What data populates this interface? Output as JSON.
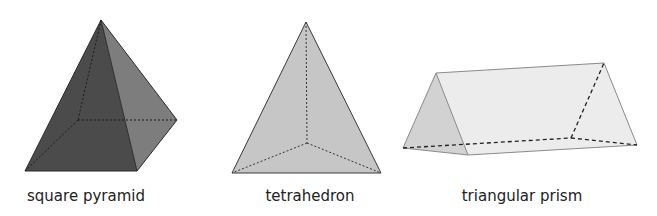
{
  "shapes": [
    {
      "id": "square-pyramid",
      "label": "square pyramid",
      "label_center_x": 86,
      "colors": {
        "front": "#4b4b4b",
        "left": "#535353",
        "right": "#7d7d7d",
        "edge": "#2a2a2a"
      }
    },
    {
      "id": "tetrahedron",
      "label": "tetrahedron",
      "label_center_x": 310,
      "colors": {
        "face": "#c6c6c6",
        "edge": "#3a3a3a"
      }
    },
    {
      "id": "triangular-prism",
      "label": "triangular prism",
      "label_center_x": 522,
      "colors": {
        "front": "#d2d2d2",
        "side": "#ececec",
        "edge": "#8a8a8a",
        "hidden": "#222222"
      }
    }
  ]
}
